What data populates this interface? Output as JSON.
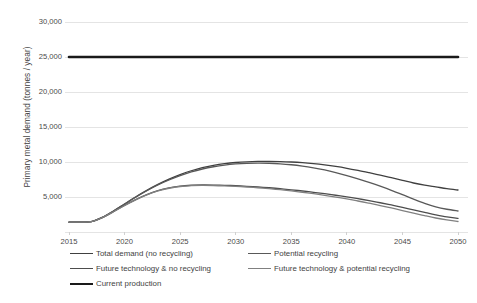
{
  "chart_data": {
    "type": "line",
    "title": "",
    "subtitle": "",
    "xlabel": "",
    "ylabel": "Primary metal demand (tonnes / year)",
    "xlim": [
      2015,
      2050
    ],
    "ylim": [
      0,
      30000
    ],
    "grid": true,
    "grid_axis": "y",
    "legend_position": "bottom",
    "x_ticks": [
      "2015",
      "2020",
      "2025",
      "2030",
      "2035",
      "2040",
      "2045",
      "2050"
    ],
    "x_tick_values": [
      2015,
      2020,
      2025,
      2030,
      2035,
      2040,
      2045,
      2050
    ],
    "y_ticks": [
      "5,000",
      "10,000",
      "15,000",
      "20,000",
      "25,000",
      "30,000"
    ],
    "y_tick_values": [
      5000,
      10000,
      15000,
      20000,
      25000,
      30000
    ],
    "x": [
      2015,
      2016,
      2017,
      2018,
      2019,
      2020,
      2021,
      2022,
      2023,
      2024,
      2025,
      2026,
      2027,
      2028,
      2029,
      2030,
      2031,
      2032,
      2033,
      2034,
      2035,
      2036,
      2037,
      2038,
      2039,
      2040,
      2041,
      2042,
      2043,
      2044,
      2045,
      2046,
      2047,
      2048,
      2049,
      2050
    ],
    "series": [
      {
        "name": "Total demand (no recycling)",
        "color": "#404040",
        "width": 1.3,
        "values": [
          1400,
          1420,
          1480,
          2100,
          3000,
          4000,
          5000,
          5950,
          6800,
          7550,
          8200,
          8750,
          9200,
          9520,
          9760,
          9930,
          10030,
          10080,
          10090,
          10060,
          10000,
          9900,
          9760,
          9580,
          9360,
          9100,
          8800,
          8470,
          8120,
          7760,
          7380,
          7000,
          6700,
          6450,
          6200,
          6000
        ]
      },
      {
        "name": "Potential recycling",
        "color": "#595959",
        "width": 1.3,
        "values": [
          1400,
          1420,
          1480,
          2100,
          3000,
          4000,
          4980,
          5900,
          6720,
          7430,
          8050,
          8580,
          9000,
          9320,
          9560,
          9720,
          9810,
          9840,
          9820,
          9740,
          9610,
          9420,
          9170,
          8860,
          8490,
          8070,
          7600,
          7090,
          6540,
          5960,
          5340,
          4700,
          4100,
          3600,
          3250,
          3000
        ]
      },
      {
        "name": "Future technology & no recycling",
        "color": "#4d4d4d",
        "width": 1.3,
        "values": [
          1400,
          1420,
          1470,
          2050,
          2900,
          3800,
          4620,
          5330,
          5900,
          6300,
          6560,
          6680,
          6720,
          6710,
          6670,
          6610,
          6530,
          6430,
          6320,
          6190,
          6030,
          5860,
          5670,
          5470,
          5250,
          5020,
          4760,
          4480,
          4180,
          3860,
          3520,
          3160,
          2800,
          2450,
          2150,
          1950
        ]
      },
      {
        "name": "Future technology & potential recycling",
        "color": "#808080",
        "width": 1.3,
        "values": [
          1400,
          1420,
          1470,
          2050,
          2900,
          3790,
          4600,
          5300,
          5860,
          6250,
          6500,
          6620,
          6660,
          6640,
          6590,
          6520,
          6430,
          6320,
          6190,
          6040,
          5870,
          5680,
          5470,
          5240,
          4990,
          4720,
          4430,
          4110,
          3780,
          3430,
          3070,
          2700,
          2340,
          2000,
          1720,
          1500
        ]
      },
      {
        "name": "Current production",
        "color": "#1a1a1a",
        "width": 2.6,
        "values": [
          25000,
          25000,
          25000,
          25000,
          25000,
          25000,
          25000,
          25000,
          25000,
          25000,
          25000,
          25000,
          25000,
          25000,
          25000,
          25000,
          25000,
          25000,
          25000,
          25000,
          25000,
          25000,
          25000,
          25000,
          25000,
          25000,
          25000,
          25000,
          25000,
          25000,
          25000,
          25000,
          25000,
          25000,
          25000,
          25000
        ]
      }
    ],
    "legend_entries": [
      {
        "label": "Total demand (no recycling)",
        "color": "#404040",
        "width": 1.8
      },
      {
        "label": "Potential recycling",
        "color": "#595959",
        "width": 1.6
      },
      {
        "label": "Future technology & no recycling",
        "color": "#4d4d4d",
        "width": 1.8
      },
      {
        "label": "Future technology & potential recycling",
        "color": "#808080",
        "width": 1.6
      },
      {
        "label": "Current production",
        "color": "#1a1a1a",
        "width": 2.6
      }
    ],
    "colors": {
      "gridline": "#e4e4e4",
      "plot_background": "#ffffff",
      "tick_text": "#4a4a4a"
    }
  }
}
